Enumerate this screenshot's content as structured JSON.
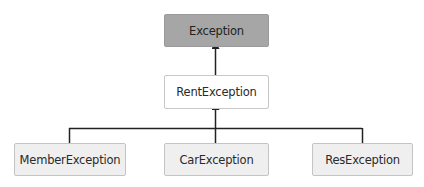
{
  "diagram": {
    "type": "class-hierarchy",
    "nodes": {
      "root": {
        "label": "Exception",
        "fill": "#a6a6a6"
      },
      "mid": {
        "label": "RentException",
        "fill": "#ffffff"
      },
      "leaves": [
        {
          "label": "MemberException",
          "fill": "#efefef"
        },
        {
          "label": "CarException",
          "fill": "#efefef"
        },
        {
          "label": "ResException",
          "fill": "#efefef"
        }
      ]
    },
    "edges": [
      {
        "from": "RentException",
        "to": "Exception",
        "arrow": "to"
      },
      {
        "from": "MemberException",
        "to": "RentException",
        "arrow": "to"
      },
      {
        "from": "CarException",
        "to": "RentException",
        "arrow": "to"
      },
      {
        "from": "ResException",
        "to": "RentException",
        "arrow": "to"
      }
    ],
    "line_color": "#222222"
  }
}
